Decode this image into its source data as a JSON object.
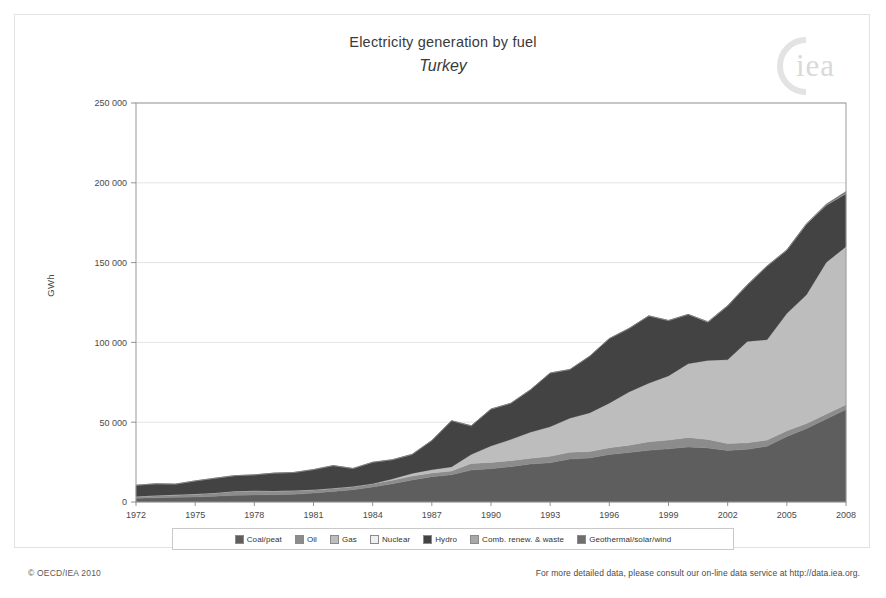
{
  "header": {
    "title": "Electricity generation by fuel",
    "subtitle": "Turkey",
    "logo_text": "iea",
    "logo_name": "iea-logo"
  },
  "axes": {
    "ylabel": "GWh",
    "ytick_labels": [
      "0",
      "50 000",
      "100 000",
      "150 000",
      "200 000",
      "250 000"
    ],
    "xtick_labels": [
      "1972",
      "1975",
      "1978",
      "1981",
      "1984",
      "1987",
      "1990",
      "1993",
      "1996",
      "1999",
      "2002",
      "2005",
      "2008"
    ]
  },
  "footer": {
    "copyright": "© OECD/IEA 2010",
    "note": "For more detailed data, please consult our on-line data service at http://data.iea.org."
  },
  "colors": {
    "coal": "#5e5e5e",
    "oil": "#8c8c8c",
    "gas": "#bdbdbd",
    "nuclear": "#efefef",
    "hydro": "#434343",
    "comb": "#a8a8a8",
    "geothermal": "#6e6e6e",
    "grid": "#d8d8d8",
    "axis": "#9a9a9a"
  },
  "chart_data": {
    "type": "area",
    "stacked": true,
    "title": "Electricity generation by fuel",
    "subtitle": "Turkey",
    "xlabel": "",
    "ylabel": "GWh",
    "ylim": [
      0,
      250000
    ],
    "ytick_step": 50000,
    "grid": true,
    "legend_position": "bottom",
    "x": [
      1972,
      1973,
      1974,
      1975,
      1976,
      1977,
      1978,
      1979,
      1980,
      1981,
      1982,
      1983,
      1984,
      1985,
      1986,
      1987,
      1988,
      1989,
      1990,
      1991,
      1992,
      1993,
      1994,
      1995,
      1996,
      1997,
      1998,
      1999,
      2000,
      2001,
      2002,
      2003,
      2004,
      2005,
      2006,
      2007,
      2008
    ],
    "categories": [
      1972,
      1973,
      1974,
      1975,
      1976,
      1977,
      1978,
      1979,
      1980,
      1981,
      1982,
      1983,
      1984,
      1985,
      1986,
      1987,
      1988,
      1989,
      1990,
      1991,
      1992,
      1993,
      1994,
      1995,
      1996,
      1997,
      1998,
      1999,
      2000,
      2001,
      2002,
      2003,
      2004,
      2005,
      2006,
      2007,
      2008
    ],
    "series": [
      {
        "name": "Coal/peat",
        "color": "#5e5e5e",
        "values": [
          2300,
          2600,
          2900,
          3200,
          3600,
          4200,
          4400,
          4600,
          4800,
          5600,
          6600,
          7700,
          9400,
          11400,
          13800,
          15800,
          17000,
          20000,
          20900,
          22100,
          23800,
          24600,
          26900,
          27500,
          29800,
          31000,
          32400,
          33300,
          34400,
          33900,
          32200,
          33000,
          35000,
          41000,
          46000,
          52000,
          58000
        ]
      },
      {
        "name": "Oil",
        "color": "#8c8c8c",
        "values": [
          1200,
          1500,
          1600,
          1800,
          2100,
          2600,
          2600,
          2300,
          2400,
          2100,
          2000,
          2000,
          2100,
          2300,
          2500,
          2400,
          2400,
          4200,
          3900,
          3800,
          3600,
          4000,
          4300,
          4100,
          4200,
          4600,
          5300,
          5500,
          6000,
          5300,
          4400,
          4100,
          3800,
          3600,
          3200,
          3100,
          3000
        ]
      },
      {
        "name": "Gas",
        "color": "#bdbdbd",
        "values": [
          0,
          0,
          0,
          0,
          0,
          0,
          0,
          0,
          0,
          0,
          0,
          0,
          0,
          700,
          1600,
          2000,
          2600,
          5600,
          10300,
          13200,
          16300,
          18500,
          21200,
          24200,
          27900,
          33300,
          36700,
          40200,
          46200,
          49500,
          52500,
          63500,
          62800,
          73500,
          80700,
          95000,
          99000
        ]
      },
      {
        "name": "Nuclear",
        "color": "#efefef",
        "values": [
          0,
          0,
          0,
          0,
          0,
          0,
          0,
          0,
          0,
          0,
          0,
          0,
          0,
          0,
          0,
          0,
          0,
          0,
          0,
          0,
          0,
          0,
          0,
          0,
          0,
          0,
          0,
          0,
          0,
          0,
          0,
          0,
          0,
          0,
          0,
          0,
          0
        ]
      },
      {
        "name": "Hydro",
        "color": "#434343",
        "values": [
          7000,
          7300,
          6700,
          8200,
          9200,
          9700,
          10000,
          11200,
          11300,
          12600,
          14200,
          11300,
          13400,
          12100,
          11900,
          18300,
          28900,
          17900,
          23100,
          22700,
          26600,
          33700,
          30600,
          35500,
          40500,
          39800,
          42200,
          34700,
          30900,
          24000,
          33700,
          35300,
          46100,
          39600,
          44200,
          35800,
          33200
        ]
      },
      {
        "name": "Comb. renew. & waste",
        "color": "#a8a8a8",
        "values": [
          0,
          0,
          0,
          0,
          0,
          0,
          0,
          0,
          0,
          0,
          0,
          0,
          0,
          0,
          0,
          0,
          0,
          0,
          0,
          0,
          0,
          0,
          0,
          0,
          0,
          0,
          0,
          0,
          0,
          200,
          200,
          200,
          200,
          200,
          250,
          300,
          400
        ]
      },
      {
        "name": "Geothermal/solar/wind",
        "color": "#6e6e6e",
        "values": [
          0,
          0,
          0,
          0,
          0,
          0,
          0,
          0,
          0,
          0,
          0,
          0,
          0,
          0,
          70,
          80,
          80,
          80,
          80,
          80,
          70,
          70,
          70,
          80,
          80,
          90,
          90,
          90,
          100,
          90,
          105,
          150,
          150,
          160,
          220,
          500,
          1000
        ]
      }
    ]
  },
  "legend": {
    "items": [
      {
        "label": "Coal/peat",
        "color": "#5e5e5e",
        "name": "legend-item-coal"
      },
      {
        "label": "Oil",
        "color": "#8c8c8c",
        "name": "legend-item-oil"
      },
      {
        "label": "Gas",
        "color": "#bdbdbd",
        "name": "legend-item-gas"
      },
      {
        "label": "Nuclear",
        "color": "#efefef",
        "name": "legend-item-nuclear"
      },
      {
        "label": "Hydro",
        "color": "#434343",
        "name": "legend-item-hydro"
      },
      {
        "label": "Comb. renew. & waste",
        "color": "#a8a8a8",
        "name": "legend-item-comb"
      },
      {
        "label": "Geothermal/solar/wind",
        "color": "#6e6e6e",
        "name": "legend-item-geothermal"
      }
    ]
  }
}
